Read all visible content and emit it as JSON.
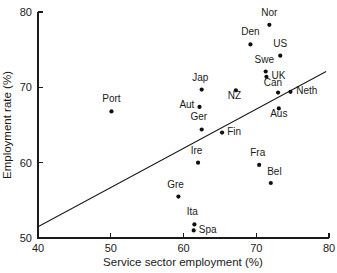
{
  "chart_data": {
    "type": "scatter",
    "title": "",
    "xlabel": "Service sector employment (%)",
    "ylabel": "Employment rate (%)",
    "xlim": [
      40,
      80
    ],
    "ylim": [
      50,
      80
    ],
    "xticks": [
      40,
      50,
      60,
      70,
      80
    ],
    "yticks": [
      50,
      60,
      70,
      80
    ],
    "xtick_labels": [
      "40",
      "50",
      "60",
      "70",
      "80"
    ],
    "ytick_labels": [
      "50",
      "60",
      "70",
      "80"
    ],
    "grid": false,
    "legend": "none",
    "points": [
      {
        "label": "Nor",
        "x": 71.8,
        "y": 78.3,
        "lx": 71.8,
        "ly": 79.5,
        "anchor": "middle"
      },
      {
        "label": "Den",
        "x": 69.2,
        "y": 75.7,
        "lx": 69.2,
        "ly": 76.9,
        "anchor": "middle"
      },
      {
        "label": "US",
        "x": 73.3,
        "y": 74.2,
        "lx": 73.3,
        "ly": 75.4,
        "anchor": "middle"
      },
      {
        "label": "Swe",
        "x": 71.3,
        "y": 72.1,
        "lx": 71.1,
        "ly": 73.2,
        "anchor": "middle"
      },
      {
        "label": "UK",
        "x": 71.4,
        "y": 71.4,
        "lx": 72.1,
        "ly": 71.1,
        "anchor": "start"
      },
      {
        "label": "Can",
        "x": 73.0,
        "y": 69.3,
        "lx": 72.3,
        "ly": 70.2,
        "anchor": "middle"
      },
      {
        "label": "Neth",
        "x": 74.7,
        "y": 69.4,
        "lx": 75.5,
        "ly": 69.1,
        "anchor": "start"
      },
      {
        "label": "Aus",
        "x": 73.1,
        "y": 67.2,
        "lx": 73.1,
        "ly": 66.1,
        "anchor": "middle"
      },
      {
        "label": "Jap",
        "x": 62.5,
        "y": 69.7,
        "lx": 62.3,
        "ly": 70.9,
        "anchor": "middle"
      },
      {
        "label": "NZ",
        "x": 67.2,
        "y": 69.6,
        "lx": 67.0,
        "ly": 68.5,
        "anchor": "middle"
      },
      {
        "label": "Aut",
        "x": 62.2,
        "y": 67.4,
        "lx": 61.5,
        "ly": 67.2,
        "anchor": "end"
      },
      {
        "label": "Port",
        "x": 50.1,
        "y": 66.8,
        "lx": 50.1,
        "ly": 68.1,
        "anchor": "middle"
      },
      {
        "label": "Ger",
        "x": 62.5,
        "y": 64.4,
        "lx": 62.1,
        "ly": 65.6,
        "anchor": "middle"
      },
      {
        "label": "Fin",
        "x": 65.3,
        "y": 64.0,
        "lx": 66.0,
        "ly": 63.7,
        "anchor": "start"
      },
      {
        "label": "Ire",
        "x": 62.0,
        "y": 60.0,
        "lx": 61.8,
        "ly": 61.2,
        "anchor": "middle"
      },
      {
        "label": "Fra",
        "x": 70.4,
        "y": 59.7,
        "lx": 70.2,
        "ly": 60.9,
        "anchor": "middle"
      },
      {
        "label": "Bel",
        "x": 72.0,
        "y": 57.3,
        "lx": 72.5,
        "ly": 58.4,
        "anchor": "middle"
      },
      {
        "label": "Gre",
        "x": 59.3,
        "y": 55.5,
        "lx": 58.9,
        "ly": 56.7,
        "anchor": "middle"
      },
      {
        "label": "Ita",
        "x": 61.5,
        "y": 51.8,
        "lx": 61.2,
        "ly": 53.0,
        "anchor": "middle"
      },
      {
        "label": "Spa",
        "x": 61.4,
        "y": 51.0,
        "lx": 62.1,
        "ly": 50.7,
        "anchor": "start"
      }
    ],
    "trend_line": {
      "x1": 40.0,
      "y1": 51.5,
      "x2": 79.6,
      "y2": 72.1
    }
  }
}
